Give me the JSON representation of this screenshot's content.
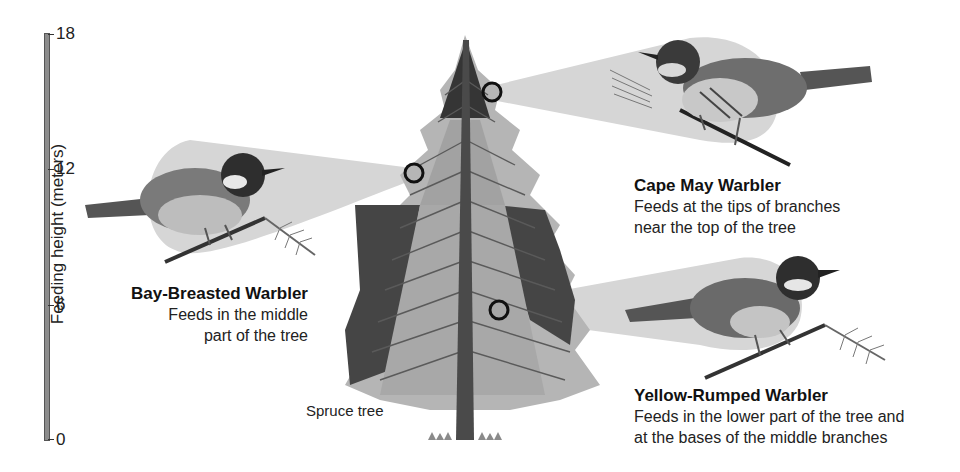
{
  "axis": {
    "label": "Feeding height (meters)",
    "ticks": [
      "18",
      "12",
      "6",
      "0"
    ]
  },
  "tree": {
    "label": "Spruce tree"
  },
  "birds": [
    {
      "name": "Cape May Warbler",
      "description_lines": [
        "Feeds at the tips of branches",
        "near the top of the tree"
      ]
    },
    {
      "name": "Bay-Breasted Warbler",
      "description_lines": [
        "Feeds in the middle",
        "part of the tree"
      ]
    },
    {
      "name": "Yellow-Rumped Warbler",
      "description_lines": [
        "Feeds in the lower part of the tree and",
        "at the bases of the middle branches"
      ]
    }
  ],
  "colors": {
    "beam": "#d9d9d9",
    "tree_light": "#b3b3b3",
    "tree_mid": "#9a9a9a",
    "tree_dark": "#3c3c3c",
    "trunk": "#4a4a4a",
    "axis_bar": "#8c8c8c"
  }
}
